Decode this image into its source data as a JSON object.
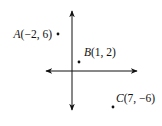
{
  "figure": {
    "type": "coordinate-plane-points",
    "axes": {
      "x_arrows": "both",
      "y_arrows": "both",
      "color": "#111111"
    },
    "points": [
      {
        "name": "A",
        "x": -2,
        "y": 6,
        "label": "A(−2, 6)"
      },
      {
        "name": "B",
        "x": 1,
        "y": 2,
        "label": "B(1, 2)"
      },
      {
        "name": "C",
        "x": 7,
        "y": -6,
        "label": "C(7, −6)"
      }
    ]
  }
}
